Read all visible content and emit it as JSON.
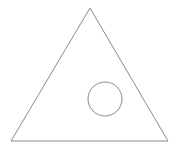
{
  "canvas": {
    "width": 179,
    "height": 152,
    "background_color": "#ffffff",
    "title": "Geometric figure: triangle with inscribed circle"
  },
  "style": {
    "stroke_color": "#8a8a8a",
    "stroke_width": 1,
    "fill": "none"
  },
  "shapes": [
    {
      "name": "triangle",
      "type": "polygon",
      "label": "Triangle",
      "points": "90,8 168,141 11,141",
      "vertices": [
        {
          "label": "apex",
          "x": 90,
          "y": 8
        },
        {
          "label": "bottom-right",
          "x": 168,
          "y": 141
        },
        {
          "label": "bottom-left",
          "x": 11,
          "y": 141
        }
      ],
      "stroke_color": "#8a8a8a",
      "stroke_width": 1,
      "fill": "none"
    },
    {
      "name": "circle",
      "type": "circle",
      "label": "Circle",
      "cx": 105,
      "cy": 99,
      "r": 17,
      "stroke_color": "#8a8a8a",
      "stroke_width": 1,
      "fill": "none"
    }
  ]
}
